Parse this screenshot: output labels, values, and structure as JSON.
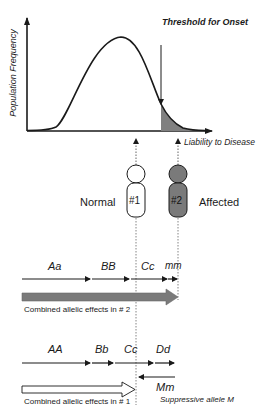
{
  "chart": {
    "threshold_label": "Threshold for Onset",
    "y_axis_label": "Population Frequency",
    "x_axis_label": "Liability to Disease"
  },
  "individuals": {
    "normal_label": "Normal",
    "affected_label": "Affected",
    "p1_label": "#1",
    "p2_label": "#2"
  },
  "row2": {
    "alleles": [
      "Aa",
      "BB",
      "Cc",
      "mm"
    ],
    "caption": "Combined allelic effects in # 2"
  },
  "row1": {
    "alleles": [
      "AA",
      "Bb",
      "Cc",
      "Dd"
    ],
    "suppressor": "Mm",
    "suppressor_caption": "Suppressive allele  M",
    "caption": "Combined allelic effects in #  1"
  },
  "colors": {
    "line": "#1a1a1a",
    "affected_fill": "#7a7a7a",
    "tail_fill": "#808080",
    "normal_fill": "#ffffff"
  }
}
